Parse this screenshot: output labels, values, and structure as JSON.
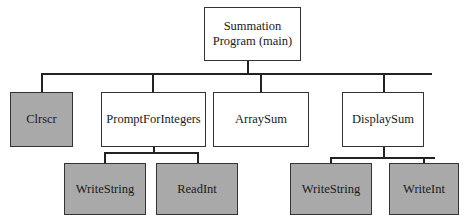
{
  "diagram": {
    "type": "structure-chart",
    "root": {
      "label_line1": "Summation",
      "label_line2": "Program (main)"
    },
    "level1": [
      {
        "id": "clrscr",
        "label": "Clrscr",
        "library": true
      },
      {
        "id": "prompt",
        "label": "PromptForIntegers",
        "library": false
      },
      {
        "id": "arraysum",
        "label": "ArraySum",
        "library": false
      },
      {
        "id": "displaysum",
        "label": "DisplaySum",
        "library": false
      }
    ],
    "level2": [
      {
        "parent": "PromptForIntegers",
        "label": "WriteString",
        "library": true
      },
      {
        "parent": "PromptForIntegers",
        "label": "ReadInt",
        "library": true
      },
      {
        "parent": "DisplaySum",
        "label": "WriteString",
        "library": true
      },
      {
        "parent": "DisplaySum",
        "label": "WriteInt",
        "library": true
      }
    ],
    "colors": {
      "library_fill": "#a9a9a9",
      "module_fill": "#ffffff",
      "line": "#222222"
    }
  }
}
